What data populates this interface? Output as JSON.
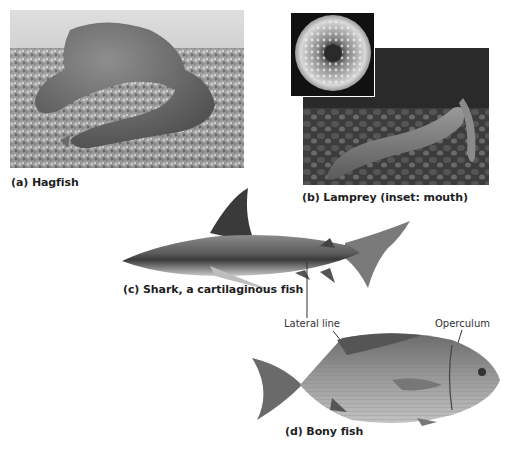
{
  "panels": {
    "hagfish": {
      "caption": "(a) Hagfish",
      "subject": "hagfish-photo"
    },
    "lamprey": {
      "caption": "(b) Lamprey (inset: mouth)",
      "subject": "lamprey-photo",
      "inset": "lamprey-mouth-inset"
    },
    "shark": {
      "caption": "(c) Shark, a cartilaginous fish",
      "subject": "shark-photo"
    },
    "bony_fish": {
      "caption": "(d) Bony fish",
      "subject": "bony-fish-photo"
    }
  },
  "labels": {
    "lateral_line": "Lateral line",
    "operculum": "Operculum"
  },
  "colors": {
    "background": "#ffffff",
    "text": "#1f1f1f",
    "leader_line": "#333333"
  }
}
